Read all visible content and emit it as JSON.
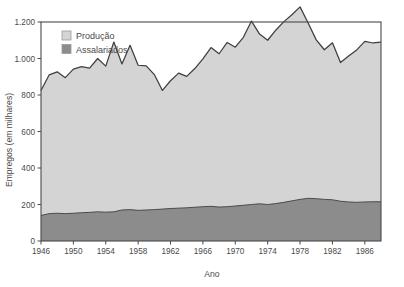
{
  "chart_data": {
    "type": "area",
    "title": "",
    "subtitle": "",
    "xlabel": "Ano",
    "ylabel": "Empregos (em milhares)",
    "stacked": true,
    "grid": false,
    "legend_position": "top-left",
    "xlim": [
      1946,
      1988
    ],
    "ylim": [
      0,
      1200
    ],
    "ytick_labels": [
      "0",
      "200",
      "400",
      "600",
      "800",
      "1.000",
      "1.200"
    ],
    "ytick_values": [
      0,
      200,
      400,
      600,
      800,
      1000,
      1200
    ],
    "xtick_labels": [
      "1946",
      "1950",
      "1954",
      "1958",
      "1962",
      "1966",
      "1970",
      "1974",
      "1978",
      "1982",
      "1986"
    ],
    "xtick_values": [
      1946,
      1950,
      1954,
      1958,
      1962,
      1966,
      1970,
      1974,
      1978,
      1982,
      1986
    ],
    "x": [
      1946,
      1947,
      1948,
      1949,
      1950,
      1951,
      1952,
      1953,
      1954,
      1955,
      1956,
      1957,
      1958,
      1959,
      1960,
      1961,
      1962,
      1963,
      1964,
      1965,
      1966,
      1967,
      1968,
      1969,
      1970,
      1971,
      1972,
      1973,
      1974,
      1975,
      1976,
      1977,
      1978,
      1979,
      1980,
      1981,
      1982,
      1983,
      1984,
      1985,
      1986,
      1987,
      1988
    ],
    "series": [
      {
        "name": "Assalariados",
        "color": "#8c8c8c",
        "values": [
          140,
          150,
          152,
          150,
          152,
          155,
          157,
          160,
          158,
          160,
          170,
          172,
          168,
          170,
          172,
          175,
          178,
          180,
          182,
          185,
          188,
          190,
          186,
          188,
          192,
          196,
          200,
          204,
          200,
          205,
          212,
          220,
          228,
          234,
          232,
          228,
          226,
          218,
          214,
          212,
          214,
          215,
          215
        ]
      },
      {
        "name": "Produção",
        "color": "#d4d4d4",
        "values": [
          685,
          760,
          775,
          745,
          790,
          800,
          790,
          840,
          800,
          930,
          800,
          900,
          795,
          790,
          740,
          650,
          700,
          740,
          720,
          760,
          810,
          870,
          840,
          900,
          870,
          920,
          1005,
          930,
          900,
          950,
          990,
          1020,
          1055,
          960,
          870,
          820,
          860,
          760,
          800,
          835,
          880,
          870,
          875
        ],
        "note": "Upper boundary = total employment (Produção, stacked on top of Assalariados)"
      }
    ],
    "legend": [
      {
        "label": "Produção",
        "color": "#d4d4d4"
      },
      {
        "label": "Assalariados",
        "color": "#8c8c8c"
      }
    ]
  }
}
